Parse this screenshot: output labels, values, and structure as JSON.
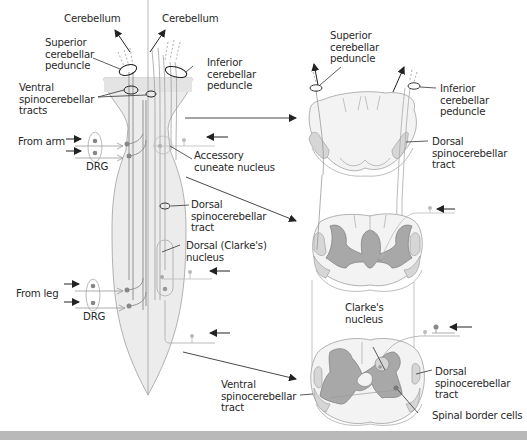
{
  "diagram": {
    "colors": {
      "cord_fill": "#ececec",
      "cord_outline": "#9a9a9a",
      "gray_matter": "#a8a8a8",
      "tract_fill": "#d4d4d4",
      "neuron_dot": "#888888",
      "line": "#333333",
      "band": "#b9b9b9"
    },
    "left_labels": {
      "cerebellum_left": "Cerebellum",
      "cerebellum_right": "Cerebellum",
      "superior_peduncle": "Superior\ncerebellar\npeduncle",
      "inferior_peduncle": "Inferior\ncerebellar\npeduncle",
      "ventral_tracts": "Ventral\nspinocerebellar\ntracts",
      "from_arm": "From arm",
      "drg_upper": "DRG",
      "accessory_cuneate": "Accessory\ncuneate nucleus",
      "dorsal_tract": "Dorsal\nspinocerebellar\ntract",
      "clarkes_nucleus": "Dorsal (Clarke's)\nnucleus",
      "from_leg": "From leg",
      "drg_lower": "DRG"
    },
    "right_labels": {
      "superior_peduncle": "Superior\ncerebellar\npeduncle",
      "inferior_peduncle": "Inferior\ncerebellar\npeduncle",
      "dorsal_tract_top": "Dorsal\nspinocerebellar\ntract",
      "clarkes_nucleus": "Clarke's\nnucleus",
      "dorsal_tract_bottom": "Dorsal\nspinocerebellar\ntract",
      "ventral_tract": "Ventral\nspinocerebellar\ntract",
      "spinal_border_cells": "Spinal border cells"
    },
    "sections": [
      "medulla",
      "thoracic",
      "lumbar"
    ]
  }
}
